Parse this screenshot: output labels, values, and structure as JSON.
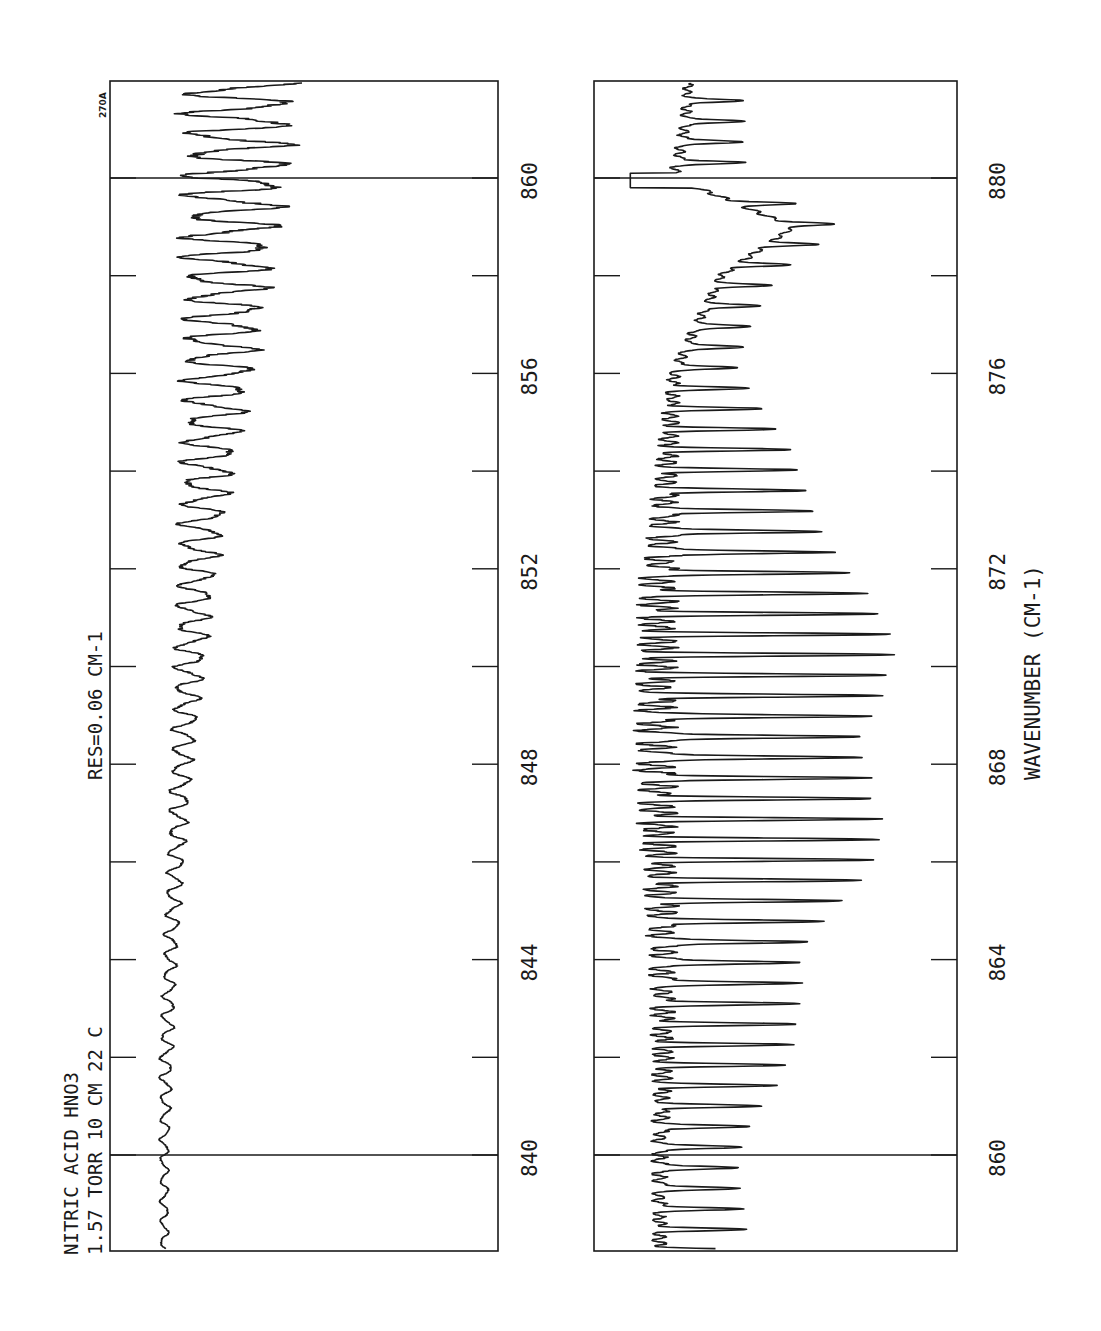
{
  "chart_data": {
    "type": "line",
    "title": "NITRIC ACID  HNO3",
    "conditions": "1.57 TORR  10 CM  22 C",
    "resolution": "RES=0.06 CM-1",
    "plot_id": "270A",
    "xlabel": "WAVENUMBER (CM-1)",
    "ylabel": "",
    "orientation": "rotated 90° — wavenumber axis runs vertically (increasing upward), transmittance horizontally",
    "grid": false,
    "legend": null,
    "panels": [
      {
        "name": "left-panel",
        "xlim": [
          838,
          862
        ],
        "major_ticks": [
          840,
          844,
          848,
          852,
          856,
          860
        ],
        "tick_labels": [
          "840",
          "844",
          "848",
          "852",
          "856",
          "860"
        ],
        "minor_ticks": [
          842,
          846,
          850,
          854,
          858
        ],
        "marker_lines": [
          840,
          860
        ],
        "description": "Nearly flat baseline from 838 to ~850 cm-1, with small-amplitude regular oscillations growing steadily toward 862 cm-1",
        "series": [
          {
            "name": "transmittance-trace",
            "x": [
              838,
              840,
              842,
              844,
              846,
              848,
              850,
              852,
              854,
              856,
              858,
              860,
              862
            ],
            "amplitude_rel": [
              0.02,
              0.02,
              0.03,
              0.03,
              0.04,
              0.05,
              0.07,
              0.09,
              0.12,
              0.16,
              0.2,
              0.24,
              0.26
            ],
            "baseline_rel": [
              0.13,
              0.13,
              0.13,
              0.14,
              0.15,
              0.16,
              0.17,
              0.18,
              0.19,
              0.2,
              0.2,
              0.2,
              0.21
            ]
          }
        ]
      },
      {
        "name": "right-panel",
        "xlim": [
          858,
          882
        ],
        "major_ticks": [
          860,
          864,
          868,
          872,
          876,
          880
        ],
        "tick_labels": [
          "860",
          "864",
          "868",
          "872",
          "876",
          "880"
        ],
        "minor_ticks": [
          862,
          866,
          870,
          874,
          878
        ],
        "marker_lines": [
          860,
          880
        ],
        "description": "Regular deep absorption bands (Q-branch-like comb) strongest around 866-870 cm-1, weakening toward 874; a broad feature peaks near 879 cm-1 with a sharp edge near 879.2, and a sharp dip at 880",
        "series": [
          {
            "name": "transmittance-trace",
            "x": [
              858,
              860,
              862,
              864,
              866,
              868,
              870,
              872,
              874,
              876,
              878,
              879,
              880,
              881,
              882
            ],
            "amplitude_rel": [
              0.22,
              0.24,
              0.32,
              0.42,
              0.55,
              0.62,
              0.62,
              0.55,
              0.35,
              0.18,
              0.15,
              0.12,
              0.2,
              0.18,
              0.15
            ],
            "baseline_rel": [
              0.18,
              0.18,
              0.19,
              0.19,
              0.18,
              0.17,
              0.17,
              0.18,
              0.2,
              0.22,
              0.35,
              0.55,
              0.22,
              0.25,
              0.26
            ]
          }
        ]
      }
    ]
  },
  "labels": {
    "title_line1": "NITRIC ACID  HNO3",
    "title_line2": "1.57 TORR  10 CM  22 C",
    "resolution": "RES=0.06 CM-1",
    "plot_id": "270A",
    "xaxis_label": "WAVENUMBER (CM-1)",
    "left_ticks": [
      "840",
      "844",
      "848",
      "852",
      "856",
      "860"
    ],
    "right_ticks": [
      "860",
      "864",
      "868",
      "872",
      "876",
      "880"
    ]
  }
}
